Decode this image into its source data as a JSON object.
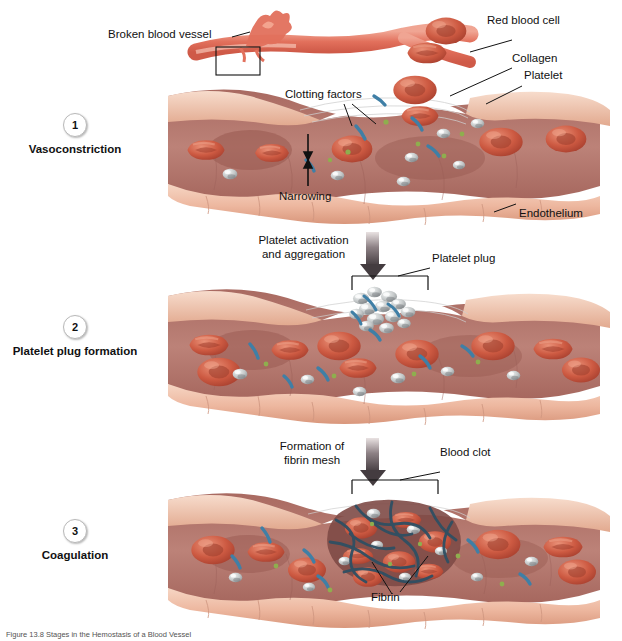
{
  "figure": {
    "caption": "Figure 13.8  Stages in the Hemostasis of a Blood Vessel",
    "background": "#ffffff"
  },
  "palette": {
    "endothelium": "#edb79f",
    "endothelium_light": "#f3cdb8",
    "endothelium_shadow": "#d98f74",
    "lumen": "#b4756a",
    "lumen_dark": "#9c5d55",
    "rbc": "#c9543e",
    "rbc_light": "#e08067",
    "rbc_dark": "#a33c2c",
    "platelet": "#b9bcbd",
    "platelet_light": "#e7eaea",
    "collagen": "#3f7fa6",
    "fibrin": "#2f4f63",
    "clotting_factor": "#8fae4e",
    "vessel": "#e2705c",
    "arrow": "#3a3336",
    "text": "#111111",
    "leader": "#111111"
  },
  "top_labels": {
    "broken_vessel": "Broken blood vessel",
    "red_blood_cell": "Red blood cell",
    "collagen": "Collagen",
    "platelet": "Platelet"
  },
  "panels": [
    {
      "number": "1",
      "caption": "Vasoconstriction",
      "labels": [
        {
          "name": "clotting-factors",
          "text": "Clotting factors"
        },
        {
          "name": "narrowing",
          "text": "Narrowing"
        },
        {
          "name": "endothelium",
          "text": "Endothelium"
        }
      ]
    },
    {
      "number": "2",
      "caption": "Platelet plug formation",
      "labels": [
        {
          "name": "platelet-plug",
          "text": "Platelet plug"
        }
      ]
    },
    {
      "number": "3",
      "caption": "Coagulation",
      "labels": [
        {
          "name": "blood-clot",
          "text": "Blood clot"
        },
        {
          "name": "fibrin",
          "text": "Fibrin"
        }
      ]
    }
  ],
  "transitions": [
    {
      "name": "platelet-activation",
      "line1": "Platelet activation",
      "line2": "and aggregation"
    },
    {
      "name": "fibrin-formation",
      "line1": "Formation of",
      "line2": "fibrin mesh"
    }
  ]
}
